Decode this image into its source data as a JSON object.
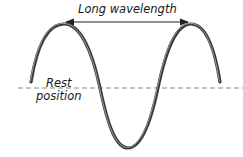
{
  "diagram": {
    "labels": {
      "wavelength": "Long wavelength",
      "rest_line1": "Rest",
      "rest_line2": "position"
    },
    "colors": {
      "wave": "#444444",
      "rest_line": "#888888",
      "arrow": "#222222",
      "text": "#1a1a1a"
    },
    "elements": {
      "wave": "sine-wave (long wavelength)",
      "rest_line": "dashed horizontal rest position line",
      "arrow": "double-headed arrow spanning one wavelength (peak to peak)"
    }
  }
}
